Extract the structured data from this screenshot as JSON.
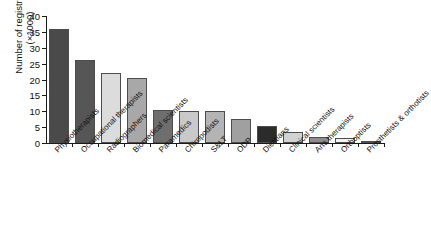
{
  "chart_data": {
    "type": "bar",
    "title": "",
    "xlabel": "",
    "ylabel": "Number of registrants (×1000)",
    "ylabel_lines": [
      "Number of registrants",
      "(×1000)"
    ],
    "ylim": [
      0,
      40
    ],
    "yticks": [
      0,
      5,
      10,
      15,
      20,
      25,
      30,
      35,
      40
    ],
    "ytick_labels": [
      "0",
      "5",
      "10",
      "15",
      "20",
      "25",
      "30",
      "35",
      "40"
    ],
    "grid": false,
    "legend": "none",
    "categories": [
      "Physiotherapists",
      "Occupational therapists",
      "Radiographers",
      "Biomedical scientists",
      "Paramedics",
      "Chiropodists",
      "S&LT",
      "ODP",
      "Dietitians",
      "Clinical scientists",
      "Arts therapists",
      "Orthoptists",
      "Prosthetists & orthotists"
    ],
    "values": [
      36,
      26,
      22,
      20.5,
      10.5,
      10,
      10,
      7.5,
      5.4,
      3.5,
      2,
      1.5,
      0.5
    ],
    "bar_colors": [
      "#4a4a4a",
      "#565656",
      "#dcdcdc",
      "#a8a8a8",
      "#6e6e6e",
      "#c9c9c9",
      "#b4b4b4",
      "#a0a0a0",
      "#2b2b2b",
      "#d2d2d2",
      "#8d8d8d",
      "#f2f2f2",
      "#5a5a5a"
    ],
    "bar_edge_color": "#4d4d4d",
    "axis_color": "#1a1a1a",
    "background": "#ffffff"
  }
}
